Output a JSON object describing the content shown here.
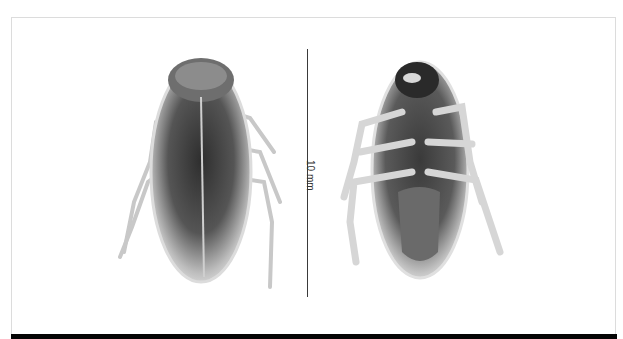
{
  "figure": {
    "panels": [
      {
        "view": "dorsal",
        "subject": "cockroach specimen"
      },
      {
        "view": "ventral",
        "subject": "cockroach specimen"
      }
    ],
    "scale_bar": {
      "label": "10 mm"
    },
    "colors": {
      "background": "#ffffff",
      "frame": "#dcdcdc",
      "band": "#050505",
      "scale_bar": "#3a3a3a"
    }
  }
}
